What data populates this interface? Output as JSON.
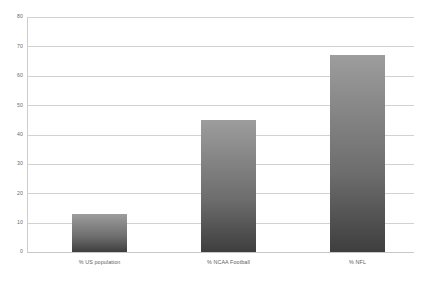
{
  "chart_data": {
    "type": "bar",
    "title": "",
    "subtitle": "",
    "xlabel": "",
    "ylabel": "",
    "categories": [
      "% US population",
      "% NCAA Football",
      "% NFL"
    ],
    "values": [
      13,
      45,
      67
    ],
    "series": [
      {
        "name": "",
        "values": [
          13,
          45,
          67
        ]
      }
    ],
    "ylim": [
      0,
      80
    ],
    "yticks": [
      0,
      10,
      20,
      30,
      40,
      50,
      60,
      70,
      80
    ],
    "ytick_labels": [
      "0",
      "10",
      "20",
      "30",
      "40",
      "50",
      "60",
      "70",
      "80"
    ],
    "grid": true,
    "legend": false,
    "legend_position": "none",
    "annotations": [],
    "colors": {
      "bar_top": "#9d9d9d",
      "bar_bottom": "#3e3e3e",
      "gridline": "#d2d2d2",
      "axis": "#cdcdcd",
      "tick_text": "#6b6b6b",
      "category_text": "#5e5e5e",
      "background": "#ffffff"
    }
  }
}
